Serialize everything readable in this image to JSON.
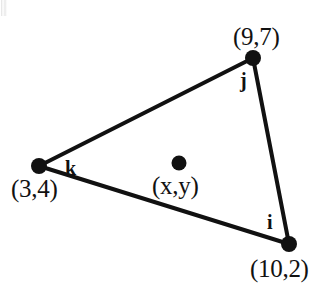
{
  "diagram": {
    "type": "triangle-with-interior-point",
    "vertices": [
      {
        "id": "j",
        "edge_label": "j",
        "coord_label": "(9,7)",
        "x": 9,
        "y": 7,
        "px": 253,
        "py": 58
      },
      {
        "id": "i",
        "edge_label": "i",
        "coord_label": "(10,2)",
        "x": 10,
        "y": 2,
        "px": 289,
        "py": 244
      },
      {
        "id": "k",
        "edge_label": "k",
        "coord_label": "(3,4)",
        "x": 3,
        "y": 4,
        "px": 39,
        "py": 166
      }
    ],
    "interior_point": {
      "coord_label": "(x,y)",
      "px": 179,
      "py": 163
    },
    "edges": [
      {
        "from": "k",
        "to": "j"
      },
      {
        "from": "j",
        "to": "i"
      },
      {
        "from": "i",
        "to": "k"
      }
    ],
    "style": {
      "stroke_color": "#111111",
      "fill_color": "#ffffff",
      "stroke_width": 4,
      "vertex_dot_radius": 8,
      "interior_dot_radius": 7.5,
      "background": "#ffffff"
    }
  }
}
